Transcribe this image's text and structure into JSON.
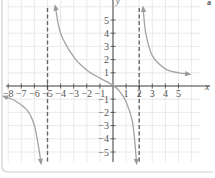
{
  "chart_data": {
    "type": "line",
    "title": "",
    "xlabel": "x",
    "ylabel": "y",
    "xlim": [
      -8.5,
      6.5
    ],
    "ylim": [
      -6,
      6
    ],
    "grid": true,
    "x_ticks": [
      -8,
      -7,
      -6,
      -5,
      -4,
      -3,
      -2,
      -1,
      1,
      2,
      3,
      4,
      5
    ],
    "y_ticks": [
      5,
      4,
      3,
      2,
      1,
      -1,
      -2,
      -3,
      -4,
      -5
    ],
    "x_tick_labels": [
      "−8",
      "−7",
      "−6",
      "−5",
      "−4",
      "−3",
      "−2",
      "−1",
      "1",
      "2",
      "3",
      "4",
      "5"
    ],
    "y_tick_labels": [
      "5",
      "4",
      "3",
      "2",
      "1",
      "−1",
      "−2",
      "−3",
      "−4",
      "−5"
    ],
    "vertical_asymptotes": [
      -5,
      2
    ],
    "horizontal_asymptote": 0,
    "series": [
      {
        "name": "left branch (x < -5)",
        "points": [
          [
            -8.3,
            -0.8
          ],
          [
            -7.5,
            -1.1
          ],
          [
            -6.5,
            -1.9
          ],
          [
            -6.0,
            -3.0
          ],
          [
            -5.7,
            -4.5
          ],
          [
            -5.5,
            -5.8
          ]
        ],
        "arrows": "both"
      },
      {
        "name": "middle branch (-5 < x < 2)",
        "points": [
          [
            -4.4,
            6.0
          ],
          [
            -4.0,
            4.0
          ],
          [
            -3.0,
            2.2
          ],
          [
            -2.0,
            1.2
          ],
          [
            -1.0,
            0.6
          ],
          [
            0.0,
            0.05
          ],
          [
            0.5,
            -0.4
          ],
          [
            1.0,
            -1.2
          ],
          [
            1.5,
            -2.8
          ],
          [
            1.8,
            -5.8
          ]
        ],
        "arrows": "both"
      },
      {
        "name": "right branch (x > 2)",
        "points": [
          [
            2.3,
            5.9
          ],
          [
            2.5,
            4.0
          ],
          [
            3.0,
            2.3
          ],
          [
            4.0,
            1.3
          ],
          [
            5.0,
            1.0
          ],
          [
            5.8,
            0.9
          ]
        ],
        "arrows": "both"
      }
    ]
  },
  "labels": {
    "x_axis": "x",
    "y_axis": "y",
    "corner": "a"
  }
}
